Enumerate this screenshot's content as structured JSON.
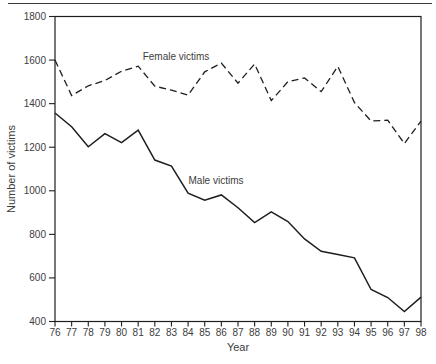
{
  "figure": {
    "y_axis_title": "Number of victims",
    "x_axis_title": "Year",
    "series_labels": {
      "female": "Female victims",
      "male": "Male victims"
    }
  },
  "colors": {
    "background": "#ffffff",
    "line": "#1e1e1e",
    "text": "#3d3d3d",
    "top_rule": "#3a3a3a"
  },
  "chart_data": {
    "type": "line",
    "title": "",
    "xlabel": "Year",
    "ylabel": "Number of victims",
    "x": [
      "76",
      "77",
      "78",
      "79",
      "80",
      "81",
      "82",
      "83",
      "84",
      "85",
      "86",
      "87",
      "88",
      "89",
      "90",
      "91",
      "92",
      "93",
      "94",
      "95",
      "96",
      "97",
      "98"
    ],
    "series": [
      {
        "name": "Female victims",
        "style": "dashed",
        "values": [
          1600,
          1437,
          1482,
          1506,
          1549,
          1572,
          1480,
          1462,
          1439,
          1546,
          1586,
          1494,
          1582,
          1414,
          1501,
          1518,
          1455,
          1571,
          1405,
          1320,
          1324,
          1217,
          1320
        ]
      },
      {
        "name": "Male victims",
        "style": "solid",
        "values": [
          1357,
          1294,
          1202,
          1262,
          1221,
          1278,
          1141,
          1113,
          989,
          957,
          981,
          922,
          854,
          903,
          859,
          779,
          722,
          708,
          692,
          547,
          510,
          446,
          512
        ]
      }
    ],
    "ylim": [
      400,
      1800
    ],
    "y_ticks": [
      400,
      600,
      800,
      1000,
      1200,
      1400,
      1600,
      1800
    ],
    "grid": false,
    "legend": "inline-labels"
  }
}
